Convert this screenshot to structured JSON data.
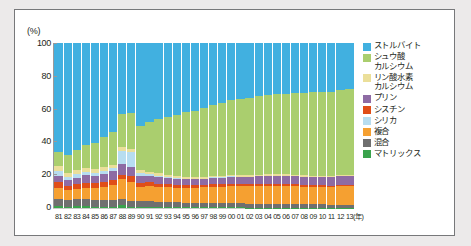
{
  "chart_data": {
    "type": "bar",
    "stacked": true,
    "title": "",
    "subtitle": "",
    "xlabel": "(年)",
    "ylabel": "(%)",
    "ylim": [
      0,
      100
    ],
    "yticks": [
      0,
      20,
      40,
      60,
      80,
      100
    ],
    "ytick_labels": [
      "0",
      "20",
      "40",
      "60",
      "80",
      "100"
    ],
    "grid": false,
    "legend_position": "right",
    "categories": [
      "81",
      "82",
      "83",
      "84",
      "85",
      "86",
      "87",
      "88",
      "89",
      "90",
      "91",
      "92",
      "93",
      "94",
      "95",
      "96",
      "97",
      "98",
      "99",
      "00",
      "01",
      "02",
      "03",
      "04",
      "05",
      "06",
      "07",
      "08",
      "09",
      "10",
      "11",
      "12",
      "13"
    ],
    "series": [
      {
        "name": "マトリックス",
        "color": "#3aa34c",
        "values": [
          1.2,
          0.9,
          1.0,
          1.0,
          0.9,
          0.8,
          0.8,
          2.0,
          0.7,
          0.6,
          0.6,
          0.6,
          0.5,
          0.5,
          0.5,
          0.5,
          0.4,
          0.4,
          0.4,
          0.4,
          0.4,
          0.3,
          0.3,
          0.3,
          0.3,
          0.3,
          0.3,
          0.3,
          0.3,
          0.3,
          0.3,
          0.3,
          0.3
        ]
      },
      {
        "name": "混合",
        "color": "#6f6f6f",
        "values": [
          4.5,
          4.0,
          4.2,
          4.5,
          4.0,
          4.2,
          4.0,
          3.6,
          3.6,
          3.4,
          3.4,
          3.2,
          3.0,
          3.0,
          2.8,
          2.8,
          2.6,
          2.6,
          2.5,
          2.4,
          2.4,
          2.3,
          2.2,
          2.2,
          2.1,
          2.0,
          2.0,
          2.0,
          1.9,
          1.9,
          1.8,
          1.8,
          1.8
        ]
      },
      {
        "name": "複合",
        "color": "#f5a031",
        "values": [
          6.5,
          6.0,
          6.5,
          6.8,
          7.5,
          8.0,
          9.0,
          12.0,
          11.5,
          9.0,
          9.5,
          9.0,
          9.0,
          8.5,
          9.0,
          9.0,
          9.5,
          10.0,
          10.0,
          10.5,
          10.5,
          10.5,
          11.0,
          11.0,
          11.0,
          11.0,
          11.0,
          10.5,
          10.5,
          10.5,
          10.5,
          11.0,
          11.0
        ]
      },
      {
        "name": "シスチン",
        "color": "#e04e18",
        "values": [
          3.5,
          2.5,
          2.8,
          3.0,
          2.8,
          2.5,
          3.0,
          2.6,
          3.5,
          2.2,
          2.0,
          2.0,
          1.8,
          1.8,
          1.6,
          1.6,
          1.5,
          1.5,
          1.4,
          1.4,
          1.3,
          1.3,
          1.2,
          1.2,
          1.2,
          1.1,
          1.1,
          1.1,
          1.0,
          1.0,
          1.0,
          1.0,
          1.0
        ]
      },
      {
        "name": "プリン",
        "color": "#8e6ba4",
        "values": [
          4.0,
          3.5,
          4.0,
          4.5,
          4.0,
          5.0,
          5.5,
          6.5,
          5.5,
          4.0,
          4.0,
          4.0,
          3.8,
          3.8,
          3.6,
          3.6,
          3.5,
          3.8,
          4.0,
          4.2,
          4.2,
          4.5,
          4.5,
          4.8,
          4.8,
          5.0,
          5.0,
          5.0,
          5.0,
          5.0,
          5.0,
          5.2,
          5.2
        ]
      },
      {
        "name": "シリカ",
        "color": "#b7ddf0",
        "values": [
          2.5,
          2.0,
          2.0,
          2.0,
          2.0,
          2.0,
          2.0,
          8.0,
          9.0,
          2.0,
          1.0,
          0.8,
          0.6,
          0.5,
          0.4,
          0.4,
          0.3,
          0.3,
          0.3,
          0.3,
          0.2,
          0.2,
          0.2,
          0.2,
          0.2,
          0.2,
          0.2,
          0.2,
          0.2,
          0.2,
          0.2,
          0.2,
          0.2
        ]
      },
      {
        "name": "リン酸水素カルシウム",
        "color": "#ebdf9a",
        "values": [
          3.0,
          2.5,
          2.5,
          2.5,
          2.5,
          2.5,
          2.0,
          2.0,
          2.0,
          1.8,
          1.6,
          1.5,
          1.4,
          1.3,
          1.2,
          1.2,
          1.1,
          1.0,
          1.0,
          1.0,
          0.9,
          0.9,
          0.8,
          0.8,
          0.8,
          0.8,
          0.7,
          0.7,
          0.7,
          0.7,
          0.7,
          0.7,
          0.7
        ]
      },
      {
        "name": "シュウ酸カルシウム",
        "color": "#aace6e",
        "values": [
          9.0,
          11.0,
          12.0,
          14.0,
          16.0,
          18.0,
          20.0,
          20.0,
          22.0,
          27.0,
          30.0,
          33.0,
          35.0,
          37.0,
          39.0,
          40.0,
          42.0,
          43.0,
          44.0,
          45.0,
          46.0,
          47.0,
          47.5,
          48.0,
          48.5,
          49.0,
          49.5,
          50.0,
          50.5,
          51.0,
          51.0,
          51.5,
          52.0
        ]
      },
      {
        "name": "ストルバイト",
        "color": "#41b0e0",
        "values": [
          65.8,
          67.6,
          65.0,
          61.7,
          60.3,
          57.0,
          53.7,
          43.3,
          42.2,
          50.0,
          47.9,
          45.9,
          44.9,
          43.6,
          41.9,
          40.9,
          39.1,
          37.4,
          36.4,
          34.8,
          34.1,
          33.0,
          32.3,
          31.5,
          31.1,
          30.6,
          30.2,
          30.2,
          29.9,
          29.4,
          29.5,
          28.3,
          27.8
        ]
      }
    ],
    "legend": [
      {
        "label": "ストルバイト",
        "color": "#41b0e0"
      },
      {
        "label": "シュウ酸\nカルシウム",
        "color": "#aace6e"
      },
      {
        "label": "リン酸水素\nカルシウム",
        "color": "#ebdf9a"
      },
      {
        "label": "プリン",
        "color": "#8e6ba4"
      },
      {
        "label": "シスチン",
        "color": "#e04e18"
      },
      {
        "label": "シリカ",
        "color": "#b7ddf0"
      },
      {
        "label": "複合",
        "color": "#f5a031"
      },
      {
        "label": "混合",
        "color": "#6f6f6f"
      },
      {
        "label": "マトリックス",
        "color": "#3aa34c"
      }
    ]
  }
}
